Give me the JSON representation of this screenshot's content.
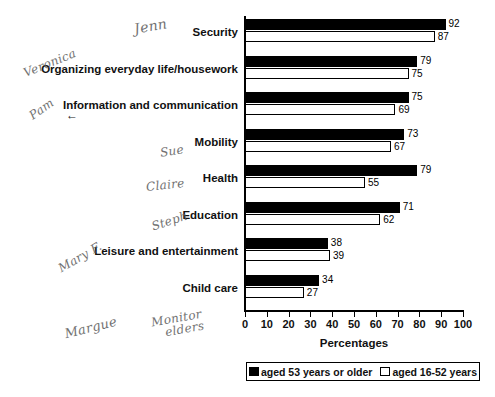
{
  "chart_data": {
    "type": "bar",
    "orientation": "horizontal",
    "title": "",
    "xlabel": "Percentages",
    "ylabel": "",
    "xlim": [
      0,
      100
    ],
    "xticks": [
      0,
      10,
      20,
      30,
      40,
      50,
      60,
      70,
      80,
      90,
      100
    ],
    "grid": false,
    "legend_position": "bottom",
    "categories": [
      "Security",
      "Organizing everyday life/housework",
      "Information and communication",
      "Mobility",
      "Health",
      "Education",
      "Leisure and entertainment",
      "Child care"
    ],
    "series": [
      {
        "name": "aged 53 years or older",
        "color": "#000000",
        "values": [
          92,
          79,
          75,
          73,
          79,
          71,
          38,
          34
        ]
      },
      {
        "name": "aged 16-52 years",
        "color": "#ffffff",
        "values": [
          87,
          75,
          69,
          67,
          55,
          62,
          39,
          27
        ]
      }
    ]
  },
  "axis": {
    "x_title": "Percentages",
    "tick_labels": [
      "0",
      "10",
      "20",
      "30",
      "40",
      "50",
      "60",
      "70",
      "80",
      "90",
      "100"
    ]
  },
  "legend": {
    "items": [
      {
        "label": "aged 53 years or older",
        "swatch": "black"
      },
      {
        "label": "aged 16-52 years",
        "swatch": "white"
      }
    ]
  },
  "annotations": {
    "handwritten": [
      {
        "name": "jenn",
        "text": "Jenn"
      },
      {
        "name": "veronica",
        "text": "Veronica"
      },
      {
        "name": "pam",
        "text": "Pam"
      },
      {
        "name": "sue",
        "text": "Sue"
      },
      {
        "name": "claire",
        "text": "Claire"
      },
      {
        "name": "steph",
        "text": "Steph"
      },
      {
        "name": "mary-f",
        "text": "Mary F."
      },
      {
        "name": "margue",
        "text": "Margue"
      },
      {
        "name": "monitor-elders-line1",
        "text": "Monitor"
      },
      {
        "name": "monitor-elders-line2",
        "text": "elders"
      }
    ],
    "arrow": "←"
  }
}
